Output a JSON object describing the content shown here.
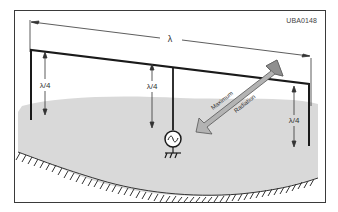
{
  "figure": {
    "code": "UBA0148",
    "wavelength_label": "λ",
    "quarter_wave_labels": [
      "λ/4",
      "λ/4",
      "λ/4"
    ],
    "arrow_text_upper": "Maximum",
    "arrow_text_lower": "Radiation",
    "components": {
      "antenna_wire": "horizontal antenna wire",
      "feed": "AC generator",
      "ground": "ground symbol"
    },
    "colors": {
      "frame": "#3a3a3a",
      "ground_fill": "#d9d9d9",
      "arrow_fill": "#b3b3b3",
      "wire": "#1a1a1a"
    }
  }
}
